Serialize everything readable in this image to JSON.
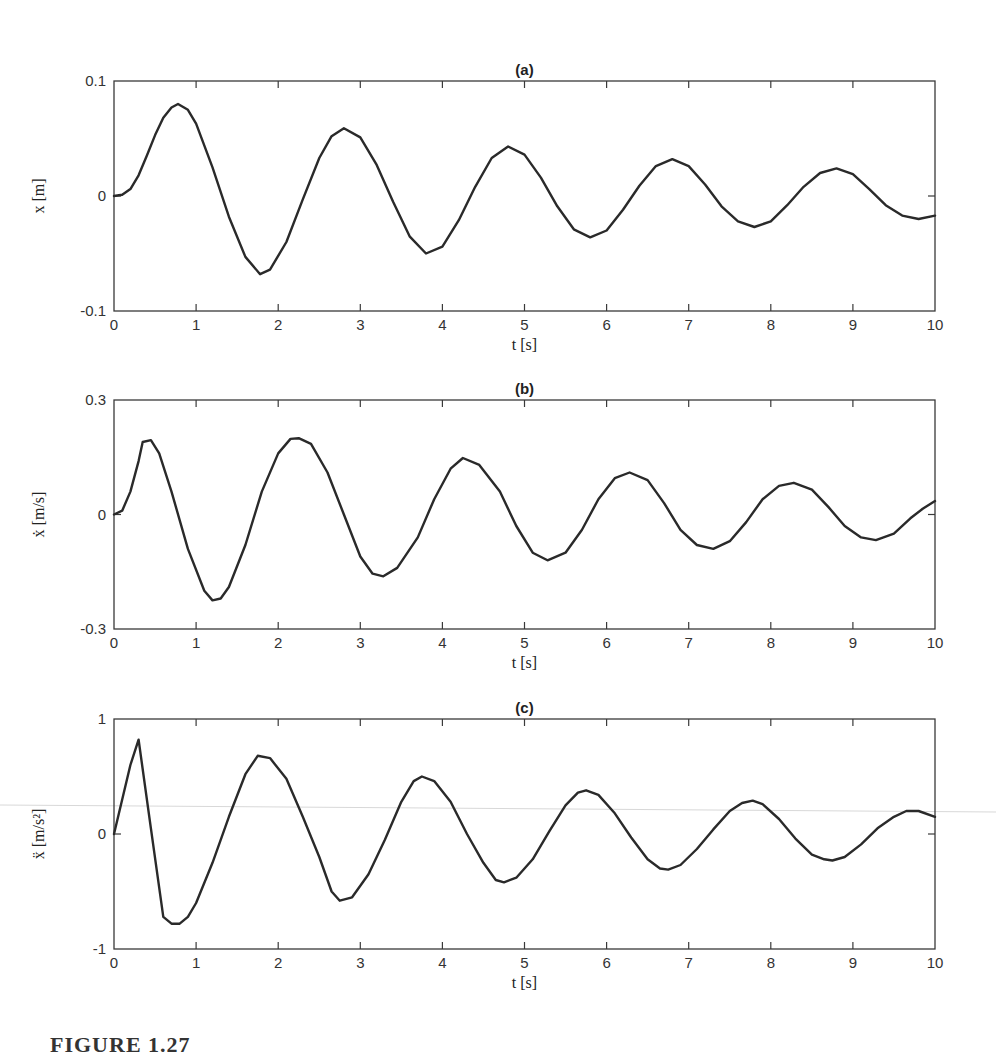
{
  "figure": {
    "caption": "FIGURE 1.27"
  },
  "chart_data": [
    {
      "type": "line",
      "panel": "(a)",
      "title": "(a)",
      "xlabel": "t [s]",
      "ylabel": "x [m]",
      "xlim": [
        0,
        10
      ],
      "ylim": [
        -0.1,
        0.1
      ],
      "xticks": [
        "0",
        "1",
        "2",
        "3",
        "4",
        "5",
        "6",
        "7",
        "8",
        "9",
        "10"
      ],
      "yticks": [
        "-0.1",
        "0",
        "0.1"
      ],
      "grid": false,
      "series": [
        {
          "name": "x",
          "x": [
            0,
            0.1,
            0.2,
            0.3,
            0.4,
            0.5,
            0.6,
            0.7,
            0.78,
            0.9,
            1.0,
            1.2,
            1.4,
            1.6,
            1.78,
            1.9,
            2.1,
            2.3,
            2.5,
            2.65,
            2.8,
            3.0,
            3.2,
            3.4,
            3.6,
            3.8,
            4.0,
            4.2,
            4.4,
            4.6,
            4.8,
            5.0,
            5.2,
            5.4,
            5.6,
            5.8,
            6.0,
            6.2,
            6.4,
            6.6,
            6.8,
            7.0,
            7.2,
            7.4,
            7.6,
            7.8,
            8.0,
            8.2,
            8.4,
            8.6,
            8.8,
            9.0,
            9.2,
            9.4,
            9.6,
            9.8,
            10.0
          ],
          "values": [
            0,
            0.001,
            0.006,
            0.018,
            0.035,
            0.053,
            0.068,
            0.077,
            0.08,
            0.075,
            0.063,
            0.025,
            -0.018,
            -0.053,
            -0.068,
            -0.064,
            -0.04,
            -0.003,
            0.033,
            0.052,
            0.059,
            0.051,
            0.027,
            -0.005,
            -0.035,
            -0.05,
            -0.044,
            -0.021,
            0.008,
            0.033,
            0.043,
            0.036,
            0.016,
            -0.009,
            -0.029,
            -0.036,
            -0.03,
            -0.012,
            0.009,
            0.026,
            0.032,
            0.026,
            0.01,
            -0.009,
            -0.022,
            -0.027,
            -0.022,
            -0.008,
            0.008,
            0.02,
            0.024,
            0.019,
            0.006,
            -0.008,
            -0.017,
            -0.02,
            -0.017
          ]
        }
      ]
    },
    {
      "type": "line",
      "panel": "(b)",
      "title": "(b)",
      "xlabel": "t [s]",
      "ylabel": "ẋ [m/s]",
      "xlim": [
        0,
        10
      ],
      "ylim": [
        -0.3,
        0.3
      ],
      "xticks": [
        "0",
        "1",
        "2",
        "3",
        "4",
        "5",
        "6",
        "7",
        "8",
        "9",
        "10"
      ],
      "yticks": [
        "-0.3",
        "0",
        "0.3"
      ],
      "grid": false,
      "series": [
        {
          "name": "x_dot",
          "x": [
            0,
            0.1,
            0.2,
            0.3,
            0.35,
            0.45,
            0.55,
            0.7,
            0.9,
            1.1,
            1.2,
            1.3,
            1.4,
            1.6,
            1.8,
            2.0,
            2.15,
            2.25,
            2.4,
            2.6,
            2.8,
            3.0,
            3.15,
            3.28,
            3.45,
            3.7,
            3.9,
            4.1,
            4.25,
            4.45,
            4.7,
            4.9,
            5.1,
            5.28,
            5.5,
            5.7,
            5.9,
            6.1,
            6.28,
            6.5,
            6.7,
            6.9,
            7.1,
            7.3,
            7.5,
            7.7,
            7.9,
            8.1,
            8.28,
            8.5,
            8.7,
            8.9,
            9.1,
            9.28,
            9.5,
            9.7,
            9.85,
            10.0
          ],
          "values": [
            0,
            0.01,
            0.06,
            0.14,
            0.19,
            0.195,
            0.16,
            0.06,
            -0.09,
            -0.2,
            -0.225,
            -0.22,
            -0.19,
            -0.08,
            0.06,
            0.16,
            0.198,
            0.2,
            0.185,
            0.11,
            0.0,
            -0.11,
            -0.155,
            -0.162,
            -0.14,
            -0.06,
            0.04,
            0.12,
            0.148,
            0.13,
            0.06,
            -0.03,
            -0.1,
            -0.12,
            -0.1,
            -0.04,
            0.04,
            0.095,
            0.11,
            0.09,
            0.03,
            -0.04,
            -0.08,
            -0.09,
            -0.07,
            -0.02,
            0.04,
            0.075,
            0.083,
            0.065,
            0.02,
            -0.03,
            -0.06,
            -0.067,
            -0.05,
            -0.01,
            0.015,
            0.035
          ]
        }
      ]
    },
    {
      "type": "line",
      "panel": "(c)",
      "title": "(c)",
      "xlabel": "t [s]",
      "ylabel": "ẍ [m/s²]",
      "xlim": [
        0,
        10
      ],
      "ylim": [
        -1,
        1
      ],
      "xticks": [
        "0",
        "1",
        "2",
        "3",
        "4",
        "5",
        "6",
        "7",
        "8",
        "9",
        "10"
      ],
      "yticks": [
        "-1",
        "0",
        "1"
      ],
      "grid": false,
      "series": [
        {
          "name": "x_ddot",
          "x": [
            0,
            0.1,
            0.2,
            0.3,
            0.45,
            0.6,
            0.7,
            0.8,
            0.9,
            1.0,
            1.2,
            1.4,
            1.6,
            1.75,
            1.9,
            2.1,
            2.3,
            2.5,
            2.65,
            2.75,
            2.9,
            3.1,
            3.3,
            3.5,
            3.65,
            3.75,
            3.9,
            4.1,
            4.3,
            4.5,
            4.65,
            4.75,
            4.9,
            5.1,
            5.3,
            5.5,
            5.65,
            5.75,
            5.9,
            6.1,
            6.3,
            6.5,
            6.65,
            6.75,
            6.9,
            7.1,
            7.3,
            7.5,
            7.65,
            7.78,
            7.9,
            8.1,
            8.3,
            8.5,
            8.65,
            8.75,
            8.9,
            9.1,
            9.3,
            9.5,
            9.65,
            9.8,
            10.0
          ],
          "values": [
            0,
            0.3,
            0.6,
            0.82,
            0.05,
            -0.72,
            -0.78,
            -0.78,
            -0.72,
            -0.6,
            -0.25,
            0.15,
            0.52,
            0.68,
            0.66,
            0.48,
            0.15,
            -0.2,
            -0.5,
            -0.58,
            -0.55,
            -0.35,
            -0.05,
            0.28,
            0.46,
            0.5,
            0.46,
            0.28,
            0.0,
            -0.25,
            -0.4,
            -0.42,
            -0.38,
            -0.22,
            0.02,
            0.25,
            0.36,
            0.38,
            0.34,
            0.18,
            -0.03,
            -0.22,
            -0.3,
            -0.31,
            -0.27,
            -0.13,
            0.04,
            0.2,
            0.27,
            0.29,
            0.26,
            0.13,
            -0.04,
            -0.18,
            -0.22,
            -0.23,
            -0.2,
            -0.09,
            0.05,
            0.15,
            0.2,
            0.2,
            0.15
          ]
        }
      ]
    }
  ]
}
